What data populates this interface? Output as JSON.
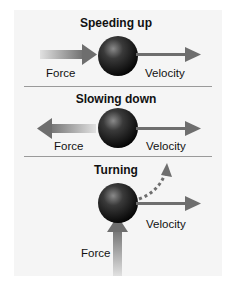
{
  "sections": [
    {
      "title": "Speeding up",
      "force_label": "Force",
      "velocity_label": "Velocity",
      "force_direction": "right"
    },
    {
      "title": "Slowing down",
      "force_label": "Force",
      "velocity_label": "Velocity",
      "force_direction": "left"
    },
    {
      "title": "Turning",
      "force_label": "Force",
      "velocity_label": "Velocity",
      "force_direction": "up",
      "path": "curved dashed arrow up-right"
    }
  ],
  "colors": {
    "panel": "#f5f5f5",
    "arrow": "#6e6e6e",
    "divider": "#9a9a9a",
    "ball": "#1a1a1a"
  }
}
